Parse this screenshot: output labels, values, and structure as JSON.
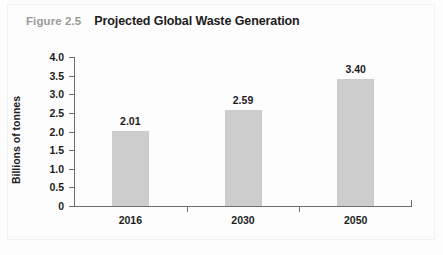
{
  "figure": {
    "number": "Figure 2.5",
    "title": "Projected Global Waste Generation"
  },
  "chart_data": {
    "type": "bar",
    "title": "Projected Global Waste Generation",
    "categories": [
      "2016",
      "2030",
      "2050"
    ],
    "values": [
      2.01,
      2.59,
      3.4
    ],
    "value_labels": [
      "2.01",
      "2.59",
      "3.40"
    ],
    "xlabel": "",
    "ylabel": "Billions of tonnes",
    "ylim": [
      0,
      4.0
    ],
    "ytick_labels": [
      "0",
      "0.5",
      "1.0",
      "1.5",
      "2.0",
      "2.5",
      "3.0",
      "3.5",
      "4.0"
    ],
    "ytick_values": [
      0,
      0.5,
      1.0,
      1.5,
      2.0,
      2.5,
      3.0,
      3.5,
      4.0
    ],
    "grid": false,
    "legend": null,
    "bar_color": "#cdcdcd",
    "axis_color": "#6e6e6e",
    "text_color": "#1c1c1c",
    "figure_number_color": "#9a9a9a",
    "background_color": "#fdfdfd"
  }
}
